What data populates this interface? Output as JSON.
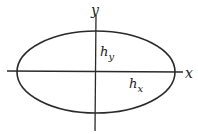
{
  "diagram": {
    "type": "ellipse-with-axes",
    "axes": {
      "x_label": "x",
      "y_label": "y"
    },
    "annotations": {
      "semi_axis_y": {
        "base": "h",
        "sub": "y"
      },
      "semi_axis_x": {
        "base": "h",
        "sub": "x"
      }
    },
    "colors": {
      "stroke": "#2a2a2a",
      "background": "#ffffff"
    }
  }
}
